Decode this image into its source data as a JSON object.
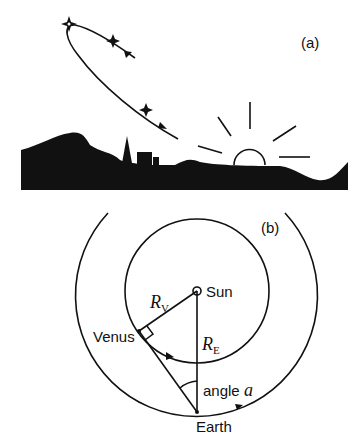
{
  "panel_a": {
    "label": "(a)",
    "elements": [
      "venus-path-with-stars",
      "landscape-silhouette",
      "church-spire",
      "buildings",
      "rising-sun",
      "sun-rays"
    ]
  },
  "panel_b": {
    "label": "(b)",
    "sun_label": "Sun",
    "venus_label": "Venus",
    "earth_label": "Earth",
    "rv_main": "R",
    "rv_sub": "V",
    "re_main": "R",
    "re_sub": "E",
    "angle_label": "angle ",
    "angle_symbol": "a"
  },
  "colors": {
    "ink": "#111111",
    "background": "#ffffff"
  }
}
